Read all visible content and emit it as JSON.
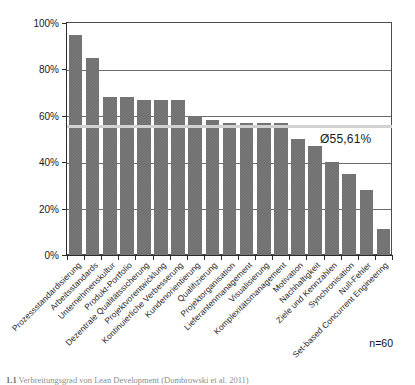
{
  "chart_data": {
    "type": "bar",
    "title": "",
    "xlabel": "",
    "ylabel": "",
    "ylim": [
      0,
      100
    ],
    "yticks": [
      "0%",
      "20%",
      "40%",
      "60%",
      "80%",
      "100%"
    ],
    "ytick_values": [
      0,
      20,
      40,
      60,
      80,
      100
    ],
    "grid": true,
    "legend": "none",
    "orientation": "vertical",
    "bar_color": "#6e6e6e",
    "average_line_color": "#d2d2d2",
    "categories": [
      "Prozessstandardisierung",
      "Arbeitsstandards",
      "Unternehmenskultur",
      "Produkt-Portfolio",
      "Dezentrale Qualitätssicherung",
      "Projektvorentwicklung",
      "Kontinuierliche Verbesserung",
      "Kundenorientierung",
      "Qualifizierung",
      "Projektorganisation",
      "Lieferantenmanagement",
      "Visualisierung",
      "Komplexitätsmanagement",
      "Motivation",
      "Nachhaltigkeit",
      "Ziele und Kennzahlen",
      "Synchronisation",
      "Null-Fehler",
      "Set-based Concurrent Engineering"
    ],
    "values": [
      95,
      85,
      68,
      68,
      67,
      67,
      67,
      60,
      58,
      57,
      57,
      57,
      57,
      50,
      47,
      40,
      35,
      28,
      11
    ],
    "annotations": [
      {
        "name": "average",
        "label": "Ø55,61%",
        "value": 55.61
      },
      {
        "name": "sample-size",
        "label": "n=60"
      }
    ]
  },
  "axis": {
    "y_labels": [
      "100%",
      "80%",
      "60%",
      "40%",
      "20%",
      "0%"
    ]
  },
  "notes": {
    "sample_size": "n=60",
    "average_label": "Ø55,61%"
  },
  "caption": {
    "number": "1.1",
    "text": "Verbreitungsgrad von Lean Development  (Dombrowski et al. 2011)"
  }
}
